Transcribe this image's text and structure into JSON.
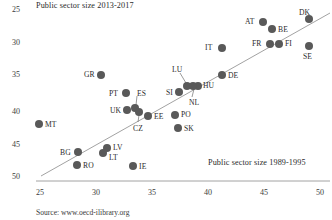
{
  "chart_data": {
    "type": "scatter",
    "title": "Public sector size 2013-2017",
    "xlabel": "Public sector size 1989-1995",
    "ylabel": "Public sector size 2013-2017",
    "xlim": [
      24,
      50.5
    ],
    "ylim": [
      24.4,
      50.6
    ],
    "xticks": [
      "25",
      "30",
      "35",
      "40",
      "45",
      "50"
    ],
    "yticks": [
      "25",
      "30",
      "35",
      "40",
      "45",
      "50"
    ],
    "grid": false,
    "legend": "none",
    "source": "Source: www.oecd-ilibrary.org",
    "trendline": {
      "x0": 25.0,
      "y0": 25.0,
      "x1": 50.2,
      "y1": 50.4
    },
    "points": [
      {
        "label": "DK",
        "x": 48.0,
        "y": 48.6,
        "px": 309,
        "py": 19,
        "lx": 299,
        "ly": 8
      },
      {
        "label": "AT",
        "x": 44.0,
        "y": 48.0,
        "px": 263,
        "py": 22,
        "lx": 245,
        "ly": 17
      },
      {
        "label": "BE",
        "x": 44.8,
        "y": 46.8,
        "px": 272,
        "py": 29,
        "lx": 278,
        "ly": 25
      },
      {
        "label": "IT",
        "x": 40.3,
        "y": 44.2,
        "px": 222,
        "py": 48,
        "lx": 205,
        "ly": 43
      },
      {
        "label": "FR",
        "x": 44.5,
        "y": 44.8,
        "px": 270,
        "py": 44,
        "lx": 252,
        "ly": 39
      },
      {
        "label": "FI",
        "x": 45.3,
        "y": 44.8,
        "px": 279,
        "py": 44,
        "lx": 285,
        "ly": 39
      },
      {
        "label": "SE",
        "x": 48.0,
        "y": 44.0,
        "px": 309,
        "py": 46,
        "lx": 303,
        "ly": 52
      },
      {
        "label": "GR",
        "x": 31.4,
        "y": 40.0,
        "px": 101,
        "py": 75,
        "lx": 84,
        "ly": 70
      },
      {
        "label": "DE",
        "x": 40.3,
        "y": 39.8,
        "px": 222,
        "py": 75,
        "lx": 228,
        "ly": 71
      },
      {
        "label": "LU",
        "x": 36.6,
        "y": 38.6,
        "px": 187,
        "py": 86,
        "lx": 172,
        "ly": 65
      },
      {
        "label": "HU",
        "x": 37.6,
        "y": 38.6,
        "px": 198,
        "py": 86,
        "lx": 203,
        "ly": 81
      },
      {
        "label": "NL",
        "x": 37.1,
        "y": 38.6,
        "px": 193,
        "py": 86,
        "lx": 189,
        "ly": 98
      },
      {
        "label": "SI",
        "x": 35.5,
        "y": 38.0,
        "px": 179,
        "py": 92,
        "lx": 166,
        "ly": 88
      },
      {
        "label": "PT",
        "x": 33.8,
        "y": 36.2,
        "px": 126,
        "py": 93,
        "lx": 109,
        "ly": 89
      },
      {
        "label": "ES",
        "x": 34.6,
        "y": 34.9,
        "px": 135,
        "py": 108,
        "lx": 137,
        "ly": 89
      },
      {
        "label": "UK",
        "x": 33.8,
        "y": 34.7,
        "px": 127,
        "py": 110,
        "lx": 110,
        "ly": 106
      },
      {
        "label": "CZ",
        "x": 35.0,
        "y": 34.4,
        "px": 139,
        "py": 112,
        "lx": 133,
        "ly": 124
      },
      {
        "label": "EE",
        "x": 35.8,
        "y": 34.0,
        "px": 148,
        "py": 116,
        "lx": 154,
        "ly": 112
      },
      {
        "label": "PO",
        "x": 37.8,
        "y": 34.1,
        "px": 175,
        "py": 115,
        "lx": 181,
        "ly": 110
      },
      {
        "label": "SK",
        "x": 38.0,
        "y": 32.8,
        "px": 178,
        "py": 128,
        "lx": 184,
        "ly": 124
      },
      {
        "label": "MT",
        "x": 28.0,
        "y": 33.4,
        "px": 39,
        "py": 124,
        "lx": 45,
        "ly": 120
      },
      {
        "label": "LV",
        "x": 31.6,
        "y": 30.8,
        "px": 107,
        "py": 148,
        "lx": 113,
        "ly": 143
      },
      {
        "label": "LT",
        "x": 31.2,
        "y": 30.3,
        "px": 103,
        "py": 153,
        "lx": 109,
        "ly": 153
      },
      {
        "label": "BG",
        "x": 29.0,
        "y": 30.0,
        "px": 78,
        "py": 152,
        "lx": 60,
        "ly": 148
      },
      {
        "label": "RO",
        "x": 28.9,
        "y": 28.7,
        "px": 77,
        "py": 165,
        "lx": 83,
        "ly": 161
      },
      {
        "label": "IE",
        "x": 32.9,
        "y": 28.6,
        "px": 133,
        "py": 166,
        "lx": 139,
        "ly": 162
      }
    ],
    "leaders": [
      {
        "from": "LU",
        "x1": 180,
        "y1": 73,
        "x2": 186,
        "y2": 83
      },
      {
        "from": "NL",
        "x1": 192,
        "y1": 97,
        "x2": 194,
        "y2": 89
      },
      {
        "from": "ES",
        "x1": 137,
        "y1": 96,
        "x2": 136,
        "y2": 105
      },
      {
        "from": "CZ",
        "x1": 138,
        "y1": 122,
        "x2": 139,
        "y2": 115
      }
    ],
    "axes": {
      "x_axis_y_px": 181,
      "x_axis_x0_px": 36,
      "x_axis_x1_px": 330,
      "xtick_px": [
        40,
        96,
        152,
        208,
        264,
        320
      ],
      "ytick_px": [
        5,
        38,
        70,
        107,
        140,
        172
      ]
    }
  }
}
